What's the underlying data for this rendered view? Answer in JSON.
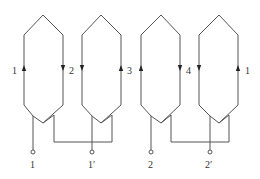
{
  "diagram": {
    "type": "winding-connection",
    "colors": {
      "line": "#555555",
      "arrow": "#222222",
      "background": "#ffffff",
      "text": "#333333"
    },
    "coils": [
      {
        "id": "coil-a",
        "left_label": "1",
        "right_label": "2",
        "left_arrow": "up",
        "right_arrow": "down"
      },
      {
        "id": "coil-b",
        "left_label": "",
        "right_label": "3",
        "left_arrow": "down",
        "right_arrow": "up"
      },
      {
        "id": "coil-c",
        "left_label": "",
        "right_label": "4",
        "left_arrow": "up",
        "right_arrow": "down"
      },
      {
        "id": "coil-d",
        "left_label": "",
        "right_label": "1",
        "left_arrow": "down",
        "right_arrow": "up"
      }
    ],
    "labels": {
      "side_1": "1",
      "side_2": "2",
      "side_3": "3",
      "side_4": "4",
      "side_1b": "1"
    },
    "terminals": [
      {
        "id": "t1",
        "label": "1"
      },
      {
        "id": "t1p",
        "label": "1′"
      },
      {
        "id": "t2",
        "label": "2"
      },
      {
        "id": "t2p",
        "label": "2′"
      }
    ],
    "connections": [
      {
        "from": "coil-a",
        "to": "coil-b",
        "note": "bottom jumper"
      },
      {
        "from": "coil-c",
        "to": "coil-d",
        "note": "bottom jumper"
      }
    ]
  }
}
